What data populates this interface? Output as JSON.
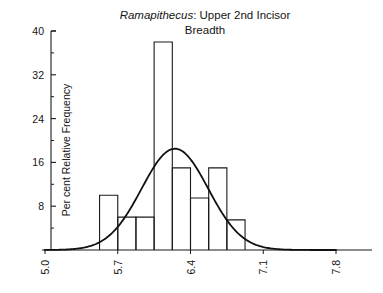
{
  "chart_data": {
    "type": "bar",
    "title": "Ramapithecus: Upper 2nd Incisor Breadth",
    "title_genus": "Ramapithecus",
    "title_rest": ": Upper 2nd Incisor",
    "title_line2": "Breadth",
    "xlabel": "",
    "ylabel": "Per cent Relative Frequency",
    "xlim": [
      5.0,
      7.8
    ],
    "ylim": [
      0,
      40
    ],
    "grid": false,
    "legend": null,
    "x_ticks": [
      5.0,
      5.7,
      6.4,
      7.1,
      7.8
    ],
    "x_tick_labels": [
      "5.0",
      "5.7",
      "6.4",
      "7.1",
      "7.8"
    ],
    "y_ticks": [
      8,
      16,
      24,
      32,
      40
    ],
    "y_tick_labels": [
      "8",
      "16",
      "24",
      "32",
      "40"
    ],
    "y_minor_ticks": [
      4,
      12,
      20,
      28,
      36
    ],
    "bin_width": 0.175,
    "bin_edges": [
      5.525,
      5.7,
      5.875,
      6.05,
      6.225,
      6.4,
      6.575,
      6.75,
      6.925,
      7.1
    ],
    "categories": [
      "5.525-5.700",
      "5.700-5.875",
      "5.875-6.050",
      "6.050-6.225",
      "6.225-6.400",
      "6.400-6.575",
      "6.575-6.750",
      "6.750-6.925"
    ],
    "values": [
      10,
      6,
      6,
      38,
      15,
      9.5,
      15,
      5.5
    ],
    "overlay": {
      "type": "line",
      "name": "normal curve",
      "mean": 6.25,
      "sd": 0.32,
      "peak_value": 18.5
    }
  }
}
